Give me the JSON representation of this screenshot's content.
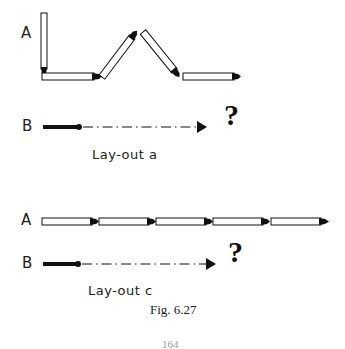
{
  "figure": {
    "number_label": "Fig. 6.27",
    "page_number": "164"
  },
  "layout_a": {
    "label_a": "A",
    "label_b": "B",
    "question_mark": "?",
    "caption": "Lay-out a",
    "matches_a": [
      {
        "from": [
          44,
          14
        ],
        "to": [
          44,
          76
        ],
        "head": "end"
      },
      {
        "from": [
          43,
          76
        ],
        "to": [
          101,
          76
        ],
        "head": "end"
      },
      {
        "from": [
          102,
          77
        ],
        "to": [
          135,
          33
        ],
        "head": "end"
      },
      {
        "from": [
          143,
          32
        ],
        "to": [
          178,
          75
        ],
        "head": "end"
      },
      {
        "from": [
          183,
          76
        ],
        "to": [
          241,
          76
        ],
        "head": "end"
      }
    ]
  },
  "layout_c": {
    "label_a": "A",
    "label_b": "B",
    "question_mark": "?",
    "caption": "Lay-out c",
    "matches_a_count": 5
  },
  "colors": {
    "ink": "#111111",
    "background": "#ffffff"
  }
}
